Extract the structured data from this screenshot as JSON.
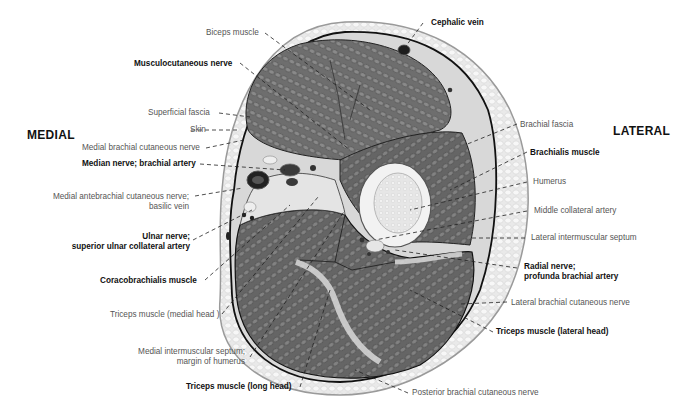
{
  "orientation": {
    "left": "MEDIAL",
    "right": "LATERAL"
  },
  "labels": {
    "biceps_muscle": "Biceps muscle",
    "musculocutaneous_nerve": "Musculocutaneous nerve",
    "superficial_fascia": "Superficial fascia",
    "skin": "Skin",
    "medial_brachial_cutaneous_nerve": "Medial brachial cutaneous nerve",
    "median_nerve_brachial_artery": "Median nerve; brachial artery",
    "medial_antebrachial_line1": "Medial antebrachial cutaneous nerve;",
    "medial_antebrachial_line2": "basilic vein",
    "ulnar_line1": "Ulnar nerve;",
    "ulnar_line2": "superior ulnar collateral artery",
    "coracobrachialis_muscle": "Coracobrachialis muscle",
    "triceps_medial_head": "Triceps muscle (medial head )",
    "medial_septum_line1": "Medial intermuscular septum;",
    "medial_septum_line2": "margin of humerus",
    "triceps_long_head": "Triceps muscle (long head)",
    "cephalic_vein": "Cephalic vein",
    "brachial_fascia": "Brachial fascia",
    "brachialis_muscle": "Brachialis muscle",
    "humerus": "Humerus",
    "middle_collateral_artery": "Middle collateral artery",
    "lateral_intermuscular_septum": "Lateral intermuscular septum",
    "radial_line1": "Radial nerve;",
    "radial_line2": "profunda brachial artery",
    "lateral_brachial_cutaneous_nerve": "Lateral brachial cutaneous nerve",
    "triceps_lateral_head": "Triceps muscle (lateral head)",
    "posterior_brachial_cutaneous_nerve": "Posterior brachial cutaneous nerve"
  }
}
